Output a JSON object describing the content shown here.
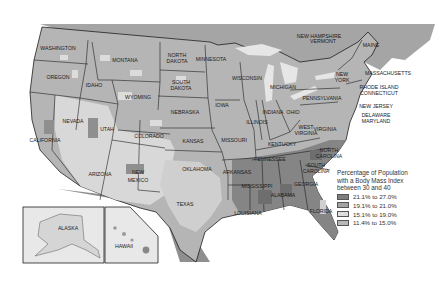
{
  "map": {
    "title_faint": "",
    "states": [
      {
        "name": "WASHINGTON",
        "x": 58,
        "y": 50
      },
      {
        "name": "OREGON",
        "x": 58,
        "y": 79
      },
      {
        "name": "CALIFORNIA",
        "x": 45,
        "y": 142
      },
      {
        "name": "NEVADA",
        "x": 73,
        "y": 123
      },
      {
        "name": "IDAHO",
        "x": 94,
        "y": 87
      },
      {
        "name": "MONTANA",
        "x": 125,
        "y": 62
      },
      {
        "name": "WYOMING",
        "x": 138,
        "y": 99
      },
      {
        "name": "UTAH",
        "x": 107,
        "y": 131
      },
      {
        "name": "COLORADO",
        "x": 149,
        "y": 138
      },
      {
        "name": "ARIZONA",
        "x": 100,
        "y": 176
      },
      {
        "name": "NEW",
        "x": 138,
        "y": 174
      },
      {
        "name": "MEXICO",
        "x": 138,
        "y": 182
      },
      {
        "name": "NORTH",
        "x": 177,
        "y": 57
      },
      {
        "name": "DAKOTA",
        "x": 177,
        "y": 63
      },
      {
        "name": "SOUTH",
        "x": 181,
        "y": 84
      },
      {
        "name": "DAKOTA",
        "x": 181,
        "y": 90
      },
      {
        "name": "NEBRASKA",
        "x": 185,
        "y": 114
      },
      {
        "name": "KANSAS",
        "x": 193,
        "y": 143
      },
      {
        "name": "OKLAHOMA",
        "x": 197,
        "y": 171
      },
      {
        "name": "TEXAS",
        "x": 185,
        "y": 206
      },
      {
        "name": "MINNESOTA",
        "x": 211,
        "y": 61
      },
      {
        "name": "IOWA",
        "x": 222,
        "y": 107
      },
      {
        "name": "MISSOURI",
        "x": 234,
        "y": 142
      },
      {
        "name": "ARKANSAS",
        "x": 237,
        "y": 174
      },
      {
        "name": "LOUISIANA",
        "x": 248,
        "y": 215
      },
      {
        "name": "WISCONSIN",
        "x": 247,
        "y": 80
      },
      {
        "name": "ILLINOIS",
        "x": 257,
        "y": 124
      },
      {
        "name": "MICHIGAN",
        "x": 283,
        "y": 89
      },
      {
        "name": "INDIANA",
        "x": 273,
        "y": 114
      },
      {
        "name": "OHIO",
        "x": 293,
        "y": 114
      },
      {
        "name": "KENTUCKY",
        "x": 282,
        "y": 146
      },
      {
        "name": "TENNESSEE",
        "x": 270,
        "y": 161
      },
      {
        "name": "MISSISSIPPI",
        "x": 257,
        "y": 188
      },
      {
        "name": "ALABAMA",
        "x": 283,
        "y": 197
      },
      {
        "name": "GEORGIA",
        "x": 306,
        "y": 186
      },
      {
        "name": "FLORIDA",
        "x": 321,
        "y": 213
      },
      {
        "name": "SOUTH",
        "x": 316,
        "y": 167
      },
      {
        "name": "CAROLINA",
        "x": 316,
        "y": 173
      },
      {
        "name": "NORTH",
        "x": 329,
        "y": 152
      },
      {
        "name": "CAROLINA",
        "x": 329,
        "y": 158
      },
      {
        "name": "WEST",
        "x": 306,
        "y": 129
      },
      {
        "name": "VIRGINIA",
        "x": 306,
        "y": 135
      },
      {
        "name": "VIRGINIA",
        "x": 325,
        "y": 131
      },
      {
        "name": "PENNSYLVANIA",
        "x": 322,
        "y": 100
      },
      {
        "name": "NEW",
        "x": 342,
        "y": 76
      },
      {
        "name": "YORK",
        "x": 342,
        "y": 82
      },
      {
        "name": "MAINE",
        "x": 371,
        "y": 47
      },
      {
        "name": "NEW HAMPSHIRE",
        "x": 319,
        "y": 38
      },
      {
        "name": "VERMONT",
        "x": 323,
        "y": 43
      },
      {
        "name": "MASSACHUSETTS",
        "x": 388,
        "y": 75
      },
      {
        "name": "RHODE ISLAND",
        "x": 379,
        "y": 89
      },
      {
        "name": "CONNECTICUT",
        "x": 379,
        "y": 95
      },
      {
        "name": "NEW JERSEY",
        "x": 376,
        "y": 108
      },
      {
        "name": "DELAWARE",
        "x": 376,
        "y": 117
      },
      {
        "name": "MARYLAND",
        "x": 376,
        "y": 123
      },
      {
        "name": "ALASKA",
        "x": 68,
        "y": 230
      },
      {
        "name": "HAWAII",
        "x": 124,
        "y": 248
      }
    ]
  },
  "legend": {
    "title_line1": "Percentage of Population",
    "title_line2": "with a Body Mass Index",
    "title_line3": "between 30 and 40",
    "items": [
      {
        "label": "21.1% to 27.0%",
        "color": "#7d7d7d"
      },
      {
        "label": "19.1% to 21.0%",
        "color": "#a3a3a3"
      },
      {
        "label": "15.1% to 19.0%",
        "color": "#dedede"
      },
      {
        "label": "11.4% to 15.0%",
        "color": "#b8b8b8"
      }
    ]
  },
  "colors": {
    "land_high": "#7d7d7d",
    "land_mid": "#a3a3a3",
    "land_low": "#dedede",
    "land_base": "#b5b5b5",
    "border": "#1e1e1e",
    "canada": "#a5a5a5",
    "water": "#ffffff"
  }
}
